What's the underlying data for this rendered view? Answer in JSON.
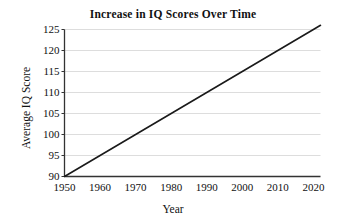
{
  "chart_data": {
    "type": "line",
    "title": "Increase in IQ Scores Over Time",
    "xlabel": "Year",
    "ylabel": "Average IQ Score",
    "xlim": [
      1950,
      2022
    ],
    "ylim": [
      90,
      125
    ],
    "xticks": [
      1950,
      1960,
      1970,
      1980,
      1990,
      2000,
      2010,
      2020
    ],
    "xtick_labels": [
      "1950",
      "1960",
      "1970",
      "1980",
      "1990",
      "2000",
      "2010",
      "2020"
    ],
    "yticks": [
      90,
      95,
      100,
      105,
      110,
      115,
      120,
      125
    ],
    "ytick_labels": [
      "90",
      "95",
      "100",
      "105",
      "110",
      "115",
      "120",
      "125"
    ],
    "grid": "horizontal",
    "grid_color": "#d9d9d9",
    "legend": "none",
    "line_color": "#1a1a1a",
    "line_width": 1.6,
    "series": [
      {
        "name": "Average IQ Score",
        "x": [
          1950,
          1960,
          1970,
          1980,
          1990,
          2000,
          2010,
          2020,
          2022
        ],
        "values": [
          90,
          95,
          100,
          105,
          110,
          115,
          120,
          125,
          126
        ]
      }
    ]
  },
  "axes": {
    "axis_color": "#333333",
    "background": "#ffffff"
  }
}
